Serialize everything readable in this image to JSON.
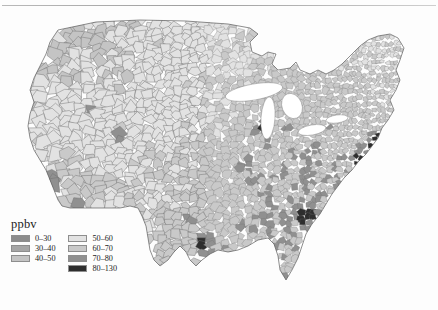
{
  "figure": {
    "clipped_header": "",
    "map_title": ""
  },
  "legend": {
    "title": "ppbv",
    "columns": [
      {
        "items": [
          {
            "label": "0–30",
            "color": "#8c8c8c",
            "min": 0,
            "max": 30
          },
          {
            "label": "30–40",
            "color": "#a6a6a6",
            "min": 30,
            "max": 40
          },
          {
            "label": "40–50",
            "color": "#c4c4c4",
            "min": 40,
            "max": 50
          }
        ]
      },
      {
        "items": [
          {
            "label": "50–60",
            "color": "#e2e2e2",
            "min": 50,
            "max": 60
          },
          {
            "label": "60–70",
            "color": "#c9c9c9",
            "min": 60,
            "max": 70
          },
          {
            "label": "70–80",
            "color": "#909090",
            "min": 70,
            "max": 80
          },
          {
            "label": "80–130",
            "color": "#2e2e2e",
            "min": 80,
            "max": 130
          }
        ]
      }
    ]
  },
  "chart_data": {
    "type": "heatmap",
    "title": "",
    "xlabel": "",
    "ylabel": "",
    "unit": "ppbv",
    "geography": "United States counties (contiguous 48 states)",
    "class_breaks": [
      0,
      30,
      40,
      50,
      60,
      70,
      80,
      130
    ],
    "class_labels": [
      "0–30",
      "30–40",
      "40–50",
      "50–60",
      "60–70",
      "70–80",
      "80–130"
    ],
    "class_colors": [
      "#8c8c8c",
      "#a6a6a6",
      "#c4c4c4",
      "#e2e2e2",
      "#c9c9c9",
      "#909090",
      "#2e2e2e"
    ],
    "projection": "albers-usa-approx",
    "map_outline": {
      "north_border": [
        [
          58,
          22
        ],
        [
          95,
          15
        ],
        [
          140,
          13
        ],
        [
          190,
          14
        ],
        [
          232,
          17
        ],
        [
          258,
          22
        ],
        [
          272,
          28
        ]
      ],
      "west_coast": [
        [
          58,
          22
        ],
        [
          48,
          40
        ],
        [
          44,
          58
        ],
        [
          38,
          74
        ],
        [
          30,
          92
        ],
        [
          26,
          110
        ],
        [
          30,
          126
        ],
        [
          36,
          142
        ],
        [
          42,
          160
        ],
        [
          50,
          176
        ],
        [
          56,
          190
        ]
      ],
      "notes": "approximate silhouette control points in svg user units"
    },
    "urban_hotspots": [
      {
        "name": "Los Angeles",
        "x": 44,
        "y": 175,
        "value": 96,
        "class": "80–130",
        "radius": 7
      },
      {
        "name": "Phoenix",
        "x": 82,
        "y": 196,
        "value": 84,
        "class": "80–130",
        "radius": 5
      },
      {
        "name": "Denver",
        "x": 123,
        "y": 128,
        "value": 86,
        "class": "80–130",
        "radius": 5
      },
      {
        "name": "Salt Lake City",
        "x": 90,
        "y": 104,
        "value": 83,
        "class": "80–130",
        "radius": 4
      },
      {
        "name": "Houston",
        "x": 205,
        "y": 236,
        "value": 95,
        "class": "80–130",
        "radius": 6
      },
      {
        "name": "Dallas",
        "x": 191,
        "y": 208,
        "value": 84,
        "class": "80–130",
        "radius": 5
      },
      {
        "name": "Chicago",
        "x": 262,
        "y": 120,
        "value": 85,
        "class": "80–130",
        "radius": 5
      },
      {
        "name": "Atlanta",
        "x": 307,
        "y": 207,
        "value": 98,
        "class": "80–130",
        "radius": 7
      },
      {
        "name": "Washington DC",
        "x": 359,
        "y": 152,
        "value": 88,
        "class": "80–130",
        "radius": 6
      },
      {
        "name": "Philadelphia",
        "x": 369,
        "y": 139,
        "value": 86,
        "class": "80–130",
        "radius": 5
      },
      {
        "name": "New York",
        "x": 378,
        "y": 130,
        "value": 87,
        "class": "80–130",
        "radius": 5
      },
      {
        "name": "Boston",
        "x": 390,
        "y": 116,
        "value": 82,
        "class": "80–130",
        "radius": 4
      },
      {
        "name": "Birmingham",
        "x": 287,
        "y": 212,
        "value": 81,
        "class": "80–130",
        "radius": 4
      },
      {
        "name": "St. Louis",
        "x": 245,
        "y": 158,
        "value": 82,
        "class": "80–130",
        "radius": 4
      },
      {
        "name": "Charlotte",
        "x": 330,
        "y": 190,
        "value": 80,
        "class": "80–130",
        "radius": 4
      }
    ],
    "regional_means": [
      {
        "region": "Pacific Northwest",
        "value": 46,
        "class": "40–50"
      },
      {
        "region": "Great Basin",
        "value": 55,
        "class": "50–60"
      },
      {
        "region": "Northern Rockies",
        "value": 52,
        "class": "50–60"
      },
      {
        "region": "Southwest deserts",
        "value": 58,
        "class": "50–60"
      },
      {
        "region": "Northern Plains",
        "value": 53,
        "class": "50–60"
      },
      {
        "region": "Southern Plains",
        "value": 62,
        "class": "60–70"
      },
      {
        "region": "Upper Midwest",
        "value": 61,
        "class": "60–70"
      },
      {
        "region": "Ohio Valley",
        "value": 68,
        "class": "60–70"
      },
      {
        "region": "Northeast",
        "value": 66,
        "class": "60–70"
      },
      {
        "region": "Southeast",
        "value": 69,
        "class": "60–70"
      },
      {
        "region": "Gulf Coast",
        "value": 70,
        "class": "70–80"
      },
      {
        "region": "Appalachians",
        "value": 67,
        "class": "60–70"
      },
      {
        "region": "Central California",
        "value": 64,
        "class": "60–70"
      }
    ],
    "great_lakes": [
      {
        "name": "Lake Superior",
        "cx": 254,
        "cy": 84,
        "rx": 29,
        "ry": 8,
        "rot": -10
      },
      {
        "name": "Lake Michigan",
        "cx": 268,
        "cy": 110,
        "rx": 7,
        "ry": 21,
        "rot": 4
      },
      {
        "name": "Lake Huron",
        "cx": 292,
        "cy": 98,
        "rx": 10,
        "ry": 13,
        "rot": -22
      },
      {
        "name": "Lake Erie",
        "cx": 312,
        "cy": 122,
        "rx": 14,
        "ry": 5,
        "rot": -10
      },
      {
        "name": "Lake Ontario",
        "cx": 337,
        "cy": 111,
        "rx": 11,
        "ry": 4,
        "rot": -8
      }
    ]
  }
}
